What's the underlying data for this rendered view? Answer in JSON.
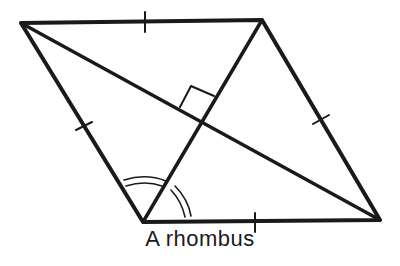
{
  "figure": {
    "caption": "A rhombus",
    "stroke_color": "#1a1a1a",
    "background": "#ffffff"
  },
  "shape": {
    "type": "rhombus",
    "vertices": [
      [
        21,
        23
      ],
      [
        262,
        20
      ],
      [
        380,
        220
      ],
      [
        143,
        222
      ]
    ],
    "diagonals": [
      [
        [
          21,
          23
        ],
        [
          380,
          220
        ]
      ],
      [
        [
          262,
          20
        ],
        [
          143,
          222
        ]
      ]
    ],
    "equal_side_tick_marks": 4,
    "right_angle_marker_at_diagonal_intersection": true,
    "equal_angle_arcs_at_vertex": [
      143,
      222
    ]
  }
}
